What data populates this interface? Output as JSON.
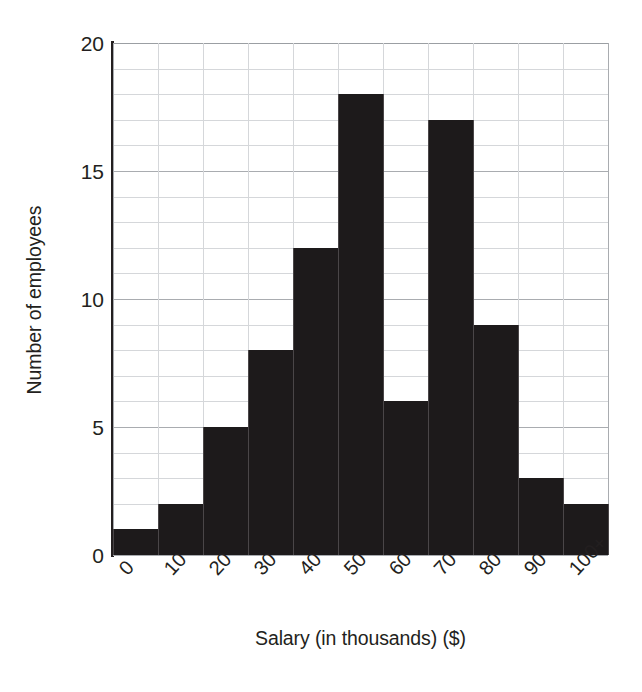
{
  "chart_data": {
    "type": "bar",
    "title": "",
    "subtitle": "",
    "xlabel": "Salary (in thousands) ($)",
    "ylabel": "Number of employees",
    "categories": [
      "0",
      "10",
      "20",
      "30",
      "40",
      "50",
      "60",
      "70",
      "80",
      "90",
      "100+"
    ],
    "bin_edges": [
      0,
      10,
      20,
      30,
      40,
      50,
      60,
      70,
      80,
      90,
      100,
      110
    ],
    "values": [
      1,
      2,
      5,
      8,
      12,
      18,
      6,
      17,
      9,
      3,
      2
    ],
    "series": [
      {
        "name": "Number of employees",
        "values": [
          1,
          2,
          5,
          8,
          12,
          18,
          6,
          17,
          9,
          3,
          2
        ]
      }
    ],
    "ylim": [
      0,
      20
    ],
    "y_major_ticks": [
      0,
      5,
      10,
      15,
      20
    ],
    "y_major_tick_labels": [
      "0",
      "5",
      "10",
      "15",
      "20"
    ],
    "y_minor_tick_step": 1,
    "grid": "both-minor-and-major",
    "legend": "none",
    "bar_color": "#1d1a1b",
    "gridline_color": "#d5d7da",
    "major_gridline_color": "#a9acb0",
    "text_color": "#231f20",
    "background_color": "#ffffff",
    "x_tick_label_rotation": -47,
    "annotations": []
  },
  "axes": {
    "y_title": "Number of employees",
    "x_title": "Salary (in thousands) ($)",
    "y_tick_labels": [
      "20",
      "15",
      "10",
      "5",
      "0"
    ],
    "x_tick_labels": [
      "0",
      "10",
      "20",
      "30",
      "40",
      "50",
      "60",
      "70",
      "80",
      "90",
      "100+"
    ]
  }
}
